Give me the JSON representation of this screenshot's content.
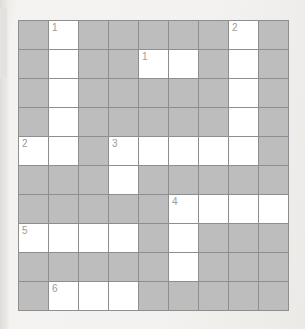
{
  "puzzle": {
    "type": "crossword-grid",
    "columns": 9,
    "rows": 10,
    "colors": {
      "block_cell": "#bdbdbd",
      "open_cell": "#ffffff",
      "grid_line": "#8e8e8e",
      "number_text": "#8a8a8a",
      "page_background": "#f2f1ef"
    },
    "legend": {
      "open": "white answer cell",
      "block": "grey blocked cell"
    },
    "cells": [
      [
        {
          "state": "block",
          "number": null
        },
        {
          "state": "open",
          "number": "1"
        },
        {
          "state": "block",
          "number": null
        },
        {
          "state": "block",
          "number": null
        },
        {
          "state": "block",
          "number": null
        },
        {
          "state": "block",
          "number": null
        },
        {
          "state": "block",
          "number": null
        },
        {
          "state": "open",
          "number": "2"
        },
        {
          "state": "block",
          "number": null
        }
      ],
      [
        {
          "state": "block",
          "number": null
        },
        {
          "state": "open",
          "number": null
        },
        {
          "state": "block",
          "number": null
        },
        {
          "state": "block",
          "number": null
        },
        {
          "state": "open",
          "number": "1"
        },
        {
          "state": "open",
          "number": null
        },
        {
          "state": "block",
          "number": null
        },
        {
          "state": "open",
          "number": null
        },
        {
          "state": "block",
          "number": null
        }
      ],
      [
        {
          "state": "block",
          "number": null
        },
        {
          "state": "open",
          "number": null
        },
        {
          "state": "block",
          "number": null
        },
        {
          "state": "block",
          "number": null
        },
        {
          "state": "block",
          "number": null
        },
        {
          "state": "block",
          "number": null
        },
        {
          "state": "block",
          "number": null
        },
        {
          "state": "open",
          "number": null
        },
        {
          "state": "block",
          "number": null
        }
      ],
      [
        {
          "state": "block",
          "number": null
        },
        {
          "state": "open",
          "number": null
        },
        {
          "state": "block",
          "number": null
        },
        {
          "state": "block",
          "number": null
        },
        {
          "state": "block",
          "number": null
        },
        {
          "state": "block",
          "number": null
        },
        {
          "state": "block",
          "number": null
        },
        {
          "state": "open",
          "number": null
        },
        {
          "state": "block",
          "number": null
        }
      ],
      [
        {
          "state": "open",
          "number": "2"
        },
        {
          "state": "open",
          "number": null
        },
        {
          "state": "block",
          "number": null
        },
        {
          "state": "open",
          "number": "3"
        },
        {
          "state": "open",
          "number": null
        },
        {
          "state": "open",
          "number": null
        },
        {
          "state": "open",
          "number": null
        },
        {
          "state": "open",
          "number": null
        },
        {
          "state": "block",
          "number": null
        }
      ],
      [
        {
          "state": "block",
          "number": null
        },
        {
          "state": "block",
          "number": null
        },
        {
          "state": "block",
          "number": null
        },
        {
          "state": "open",
          "number": null
        },
        {
          "state": "block",
          "number": null
        },
        {
          "state": "block",
          "number": null
        },
        {
          "state": "block",
          "number": null
        },
        {
          "state": "block",
          "number": null
        },
        {
          "state": "block",
          "number": null
        }
      ],
      [
        {
          "state": "block",
          "number": null
        },
        {
          "state": "block",
          "number": null
        },
        {
          "state": "block",
          "number": null
        },
        {
          "state": "block",
          "number": null
        },
        {
          "state": "block",
          "number": null
        },
        {
          "state": "open",
          "number": "4"
        },
        {
          "state": "open",
          "number": null
        },
        {
          "state": "open",
          "number": null
        },
        {
          "state": "open",
          "number": null
        }
      ],
      [
        {
          "state": "open",
          "number": "5"
        },
        {
          "state": "open",
          "number": null
        },
        {
          "state": "open",
          "number": null
        },
        {
          "state": "open",
          "number": null
        },
        {
          "state": "block",
          "number": null
        },
        {
          "state": "open",
          "number": null
        },
        {
          "state": "block",
          "number": null
        },
        {
          "state": "block",
          "number": null
        },
        {
          "state": "block",
          "number": null
        }
      ],
      [
        {
          "state": "block",
          "number": null
        },
        {
          "state": "block",
          "number": null
        },
        {
          "state": "block",
          "number": null
        },
        {
          "state": "block",
          "number": null
        },
        {
          "state": "block",
          "number": null
        },
        {
          "state": "open",
          "number": null
        },
        {
          "state": "block",
          "number": null
        },
        {
          "state": "block",
          "number": null
        },
        {
          "state": "block",
          "number": null
        }
      ],
      [
        {
          "state": "block",
          "number": null
        },
        {
          "state": "open",
          "number": "6"
        },
        {
          "state": "open",
          "number": null
        },
        {
          "state": "open",
          "number": null
        },
        {
          "state": "block",
          "number": null
        },
        {
          "state": "block",
          "number": null
        },
        {
          "state": "block",
          "number": null
        },
        {
          "state": "block",
          "number": null
        },
        {
          "state": "block",
          "number": null
        }
      ]
    ]
  }
}
